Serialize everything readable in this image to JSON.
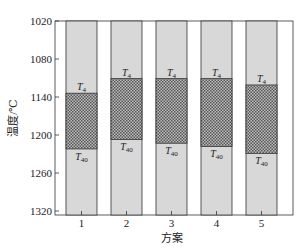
{
  "chart_data": {
    "type": "bar",
    "subtype": "floating-range",
    "title": "",
    "xlabel": "方案",
    "ylabel": "温度/℃",
    "y_inverted": true,
    "ylim": [
      1020,
      1330
    ],
    "yticks": [
      1020,
      1080,
      1140,
      1200,
      1260,
      1320
    ],
    "categories": [
      "1",
      "2",
      "3",
      "4",
      "5"
    ],
    "series": [
      {
        "name": "T4",
        "values": [
          1134,
          1111,
          1111,
          1111,
          1121
        ]
      },
      {
        "name": "T40",
        "values": [
          1222,
          1207,
          1213,
          1218,
          1229
        ]
      }
    ],
    "annotations": {
      "top_label": "T4",
      "bottom_label": "T40"
    },
    "grid": false,
    "legend": "none",
    "colors": {
      "bar_fill": "#d8d8d8",
      "hatch_fill": "#8a8a8a",
      "frame": "#333333"
    }
  }
}
